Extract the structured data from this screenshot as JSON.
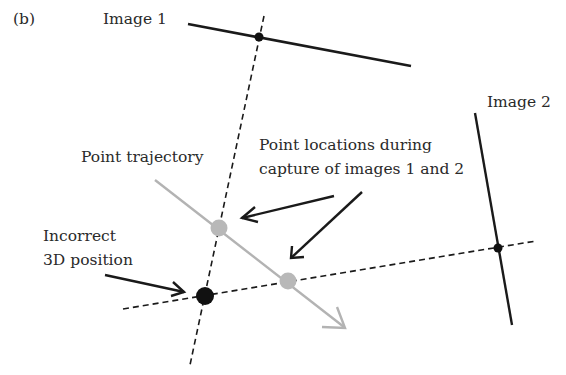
{
  "figure": {
    "panel_label": "(b)",
    "labels": {
      "image1": "Image 1",
      "image2": "Image 2",
      "trajectory": "Point trajectory",
      "locations_line1": "Point locations during",
      "locations_line2": "capture of images 1 and 2",
      "incorrect_line1": "Incorrect",
      "incorrect_line2": "3D position"
    },
    "colors": {
      "line": "#1a1a1a",
      "trajectory": "#b3b3b3",
      "point_gray": "#b8b8b8",
      "point_black": "#111111"
    }
  }
}
